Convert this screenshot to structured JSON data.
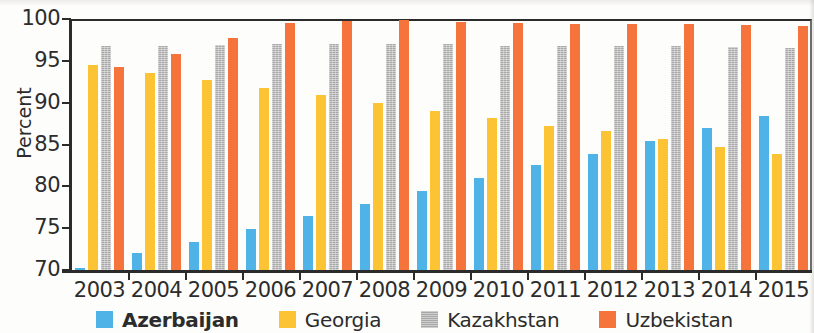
{
  "chart_data": {
    "type": "bar",
    "title": "",
    "xlabel": "",
    "ylabel": "Percent",
    "ylim": [
      70,
      100
    ],
    "yticks": [
      70,
      75,
      80,
      85,
      90,
      95,
      100
    ],
    "ytick_labels": [
      "70",
      "75",
      "80",
      "85",
      "90",
      "95",
      "100"
    ],
    "grid": false,
    "legend_position": "bottom",
    "categories": [
      "2003",
      "2004",
      "2005",
      "2006",
      "2007",
      "2008",
      "2009",
      "2010",
      "2011",
      "2012",
      "2013",
      "2014",
      "2015"
    ],
    "series": [
      {
        "name": "Azerbaijan",
        "color": "#4fb3e8",
        "emphasis": "bold",
        "values": [
          70.2,
          72.0,
          73.4,
          74.9,
          76.5,
          77.9,
          79.5,
          81.0,
          82.5,
          83.9,
          85.4,
          87.0,
          88.4
        ]
      },
      {
        "name": "Georgia",
        "color": "#fcc434",
        "emphasis": "normal",
        "values": [
          94.5,
          93.6,
          92.7,
          91.8,
          90.9,
          90.0,
          89.0,
          88.2,
          87.2,
          86.6,
          85.6,
          84.7,
          83.9
        ]
      },
      {
        "name": "Kazakhstan",
        "color": "#a8a8a8",
        "emphasis": "normal",
        "values": [
          96.8,
          96.8,
          96.9,
          97.0,
          97.0,
          97.0,
          97.0,
          96.8,
          96.8,
          96.8,
          96.8,
          96.6,
          96.5
        ]
      },
      {
        "name": "Uzbekistan",
        "color": "#f4743b",
        "emphasis": "normal",
        "values": [
          94.3,
          95.8,
          97.7,
          99.5,
          99.8,
          99.9,
          99.7,
          99.5,
          99.4,
          99.4,
          99.4,
          99.3,
          99.2
        ]
      }
    ]
  },
  "axis": {
    "y_title": "Percent"
  }
}
